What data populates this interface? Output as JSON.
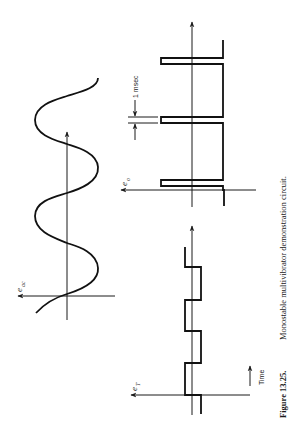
{
  "figure": {
    "number": "Figure 13.25.",
    "caption": "Monostable multivibrator demonstration circuit.",
    "orientation": "rotated-90-ccw"
  },
  "panels": {
    "sine": {
      "label_main": "e",
      "label_sub": "ac",
      "description": "AC input sine wave"
    },
    "trigger": {
      "label_main": "e",
      "label_sub": "T",
      "description": "Trigger square wave"
    },
    "output": {
      "label_main": "e",
      "label_sub": "o",
      "description": "Output pulse train",
      "pulse_width_label": "1 msec"
    }
  },
  "time_indicator": {
    "label": "Time"
  },
  "colors": {
    "ink": "#111111",
    "paper": "#ffffff"
  }
}
